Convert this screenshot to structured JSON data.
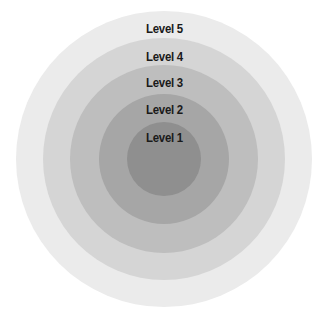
{
  "diagram": {
    "type": "concentric-circles",
    "center": [
      164,
      159
    ],
    "levels": [
      {
        "label": "Level 5",
        "radius": 148,
        "color": "#ebebeb",
        "label_y": 22
      },
      {
        "label": "Level 4",
        "radius": 121,
        "color": "#d5d5d5",
        "label_y": 50
      },
      {
        "label": "Level 3",
        "radius": 94,
        "color": "#bebebe",
        "label_y": 76
      },
      {
        "label": "Level 2",
        "radius": 65,
        "color": "#a6a6a6",
        "label_y": 103
      },
      {
        "label": "Level 1",
        "radius": 37,
        "color": "#8f8f8f",
        "label_y": 131
      }
    ]
  }
}
